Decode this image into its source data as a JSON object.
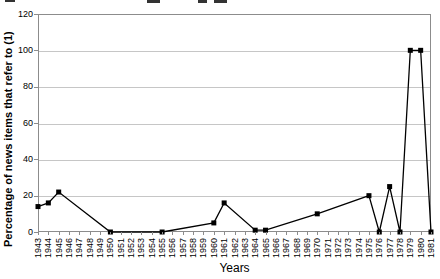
{
  "chart_data": {
    "type": "line",
    "title_cropped": true,
    "xlabel": "Years",
    "ylabel": "Percentage of news items that refer to (1)",
    "x_categories": [
      1943,
      1944,
      1945,
      1946,
      1947,
      1948,
      1949,
      1950,
      1951,
      1952,
      1953,
      1954,
      1955,
      1956,
      1957,
      1958,
      1959,
      1960,
      1961,
      1962,
      1963,
      1964,
      1965,
      1966,
      1967,
      1968,
      1969,
      1970,
      1971,
      1972,
      1973,
      1974,
      1975,
      1976,
      1977,
      1978,
      1979,
      1980,
      1981
    ],
    "yticks": [
      0,
      20,
      40,
      60,
      80,
      100,
      120
    ],
    "ylim": [
      0,
      120
    ],
    "xlim": [
      1943,
      1981
    ],
    "grid": true,
    "legend_position": "none",
    "series": [
      {
        "name": "Percentage of news items that refer to (1)",
        "marker": "square",
        "points": [
          [
            1943,
            14
          ],
          [
            1944,
            16
          ],
          [
            1945,
            22
          ],
          [
            1950,
            0
          ],
          [
            1955,
            0
          ],
          [
            1960,
            5
          ],
          [
            1961,
            16
          ],
          [
            1964,
            1
          ],
          [
            1965,
            1
          ],
          [
            1970,
            10
          ],
          [
            1975,
            20
          ],
          [
            1976,
            0
          ],
          [
            1977,
            25
          ],
          [
            1978,
            0
          ],
          [
            1979,
            100
          ],
          [
            1980,
            100
          ],
          [
            1981,
            0
          ]
        ]
      }
    ],
    "colors": {
      "line": "#000000",
      "marker": "#000000",
      "grid": "#c6c6c6",
      "plot_border": "#8c8c8c",
      "tick": "#8c8c8c",
      "text": "#000000"
    }
  }
}
